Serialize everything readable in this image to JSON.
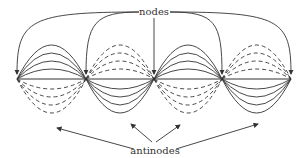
{
  "diagram": {
    "title_labels": {
      "nodes": "nodes",
      "antinodes": "antinodes"
    },
    "nodes_x": [
      17,
      86,
      154,
      222,
      291
    ],
    "baseline_y": 79,
    "segments": [
      {
        "from": 17,
        "to": 86,
        "upper": "solid",
        "lower": "dashed"
      },
      {
        "from": 86,
        "to": 154,
        "upper": "dashed",
        "lower": "solid"
      },
      {
        "from": 154,
        "to": 222,
        "upper": "solid",
        "lower": "dashed"
      },
      {
        "from": 222,
        "to": 291,
        "upper": "dashed",
        "lower": "solid"
      }
    ],
    "amplitudes": [
      10,
      18,
      26,
      34
    ],
    "colors": {
      "line": "#333333",
      "background": "#ffffff"
    }
  }
}
